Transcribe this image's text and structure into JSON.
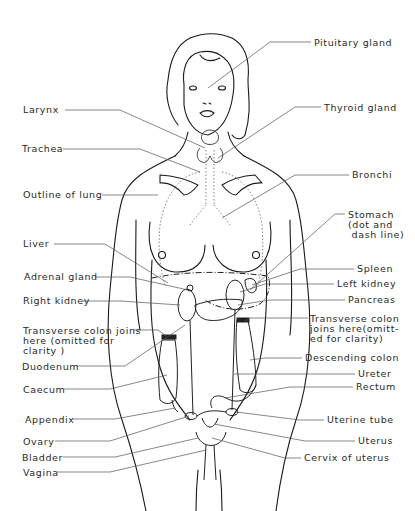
{
  "diagram": {
    "line_color": "#1a1a1a",
    "leader_color": "#555555",
    "labels_left": [
      {
        "id": "larynx",
        "text": "Larynx",
        "x": 23,
        "y": 105
      },
      {
        "id": "trachea",
        "text": "Trachea",
        "x": 22,
        "y": 144
      },
      {
        "id": "outline-of-lung",
        "text": "Outline of lung",
        "x": 23,
        "y": 190
      },
      {
        "id": "liver",
        "text": "Liver",
        "x": 23,
        "y": 239
      },
      {
        "id": "adrenal-gland",
        "text": "Adrenal gland",
        "x": 24,
        "y": 272
      },
      {
        "id": "right-kidney",
        "text": "Right kidney",
        "x": 23,
        "y": 296
      },
      {
        "id": "transverse-colon-left",
        "text": "Transverse colon joins\nhere (omitted for\nclarity )",
        "x": 23,
        "y": 326
      },
      {
        "id": "duodenum",
        "text": "Duodenum",
        "x": 22,
        "y": 362
      },
      {
        "id": "caecum",
        "text": "Caecum",
        "x": 23,
        "y": 385
      },
      {
        "id": "appendix",
        "text": "Appendix",
        "x": 25,
        "y": 415
      },
      {
        "id": "ovary",
        "text": "Ovary",
        "x": 23,
        "y": 437
      },
      {
        "id": "bladder",
        "text": "Bladder",
        "x": 22,
        "y": 453
      },
      {
        "id": "vagina",
        "text": "Vagina",
        "x": 23,
        "y": 468
      }
    ],
    "labels_right": [
      {
        "id": "pituitary-gland",
        "text": "Pituitary gland",
        "x": 314,
        "y": 38
      },
      {
        "id": "thyroid-gland",
        "text": "Thyroid gland",
        "x": 324,
        "y": 103
      },
      {
        "id": "bronchi",
        "text": "Bronchi",
        "x": 352,
        "y": 170
      },
      {
        "id": "stomach",
        "text": "Stomach\n(dot and\n dash line)",
        "x": 348,
        "y": 210
      },
      {
        "id": "spleen",
        "text": "Spleen",
        "x": 357,
        "y": 264
      },
      {
        "id": "left-kidney",
        "text": "Left kidney",
        "x": 337,
        "y": 279
      },
      {
        "id": "pancreas",
        "text": "Pancreas",
        "x": 348,
        "y": 295
      },
      {
        "id": "transverse-colon-right",
        "text": "Transverse colon\njoins here(omitt-\ned for clarity)",
        "x": 310,
        "y": 314
      },
      {
        "id": "descending-colon",
        "text": "Descending colon",
        "x": 305,
        "y": 353
      },
      {
        "id": "ureter",
        "text": "Ureter",
        "x": 358,
        "y": 369
      },
      {
        "id": "rectum",
        "text": "Rectum",
        "x": 356,
        "y": 382
      },
      {
        "id": "uterine-tube",
        "text": "Uterine tube",
        "x": 327,
        "y": 415
      },
      {
        "id": "uterus",
        "text": "Uterus",
        "x": 358,
        "y": 436
      },
      {
        "id": "cervix-of-uterus",
        "text": "Cervix of uterus",
        "x": 304,
        "y": 453
      }
    ]
  }
}
